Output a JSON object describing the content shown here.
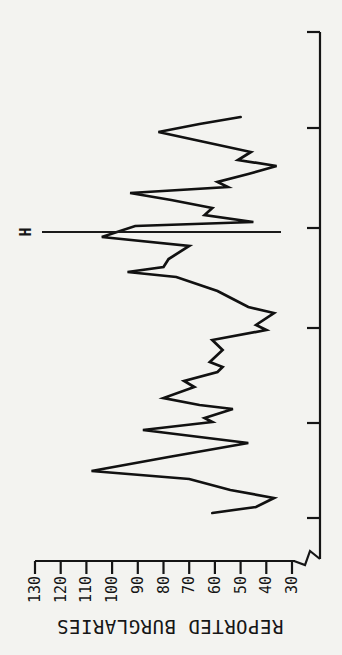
{
  "page": {
    "background": "#f3f3f0",
    "ink": "#151515"
  },
  "chart_data": {
    "type": "line",
    "title": "",
    "xlabel": "",
    "ylabel": "REPORTED BURGLARIES",
    "ylim": [
      30,
      130
    ],
    "yticks": [
      130,
      120,
      110,
      100,
      90,
      80,
      70,
      60,
      50,
      40,
      30
    ],
    "x_axis": {
      "tick_labels": [],
      "tick_positions_px": [
        137,
        232,
        327,
        427,
        527,
        623
      ],
      "axis_start_px": 96,
      "axis_end_px": 623,
      "broken_axis_at_origin": true
    },
    "annotation": {
      "label": "H",
      "x_px": 423,
      "y_top_px": 42,
      "y_bottom_px": 281
    },
    "layout": {
      "rotated_degrees_on_page": -90,
      "grid": false,
      "legend": false,
      "px_at_130": 35,
      "px_at_30": 292
    },
    "series": [
      {
        "points": [
          [
            142,
            61
          ],
          [
            148,
            44
          ],
          [
            157,
            37
          ],
          [
            165,
            54
          ],
          [
            176,
            70
          ],
          [
            184,
            108
          ],
          [
            198,
            78
          ],
          [
            212,
            47
          ],
          [
            225,
            88
          ],
          [
            233,
            61
          ],
          [
            237,
            64
          ],
          [
            246,
            53
          ],
          [
            250,
            66
          ],
          [
            257,
            80
          ],
          [
            268,
            68
          ],
          [
            274,
            72
          ],
          [
            283,
            59
          ],
          [
            288,
            57
          ],
          [
            293,
            62
          ],
          [
            305,
            57
          ],
          [
            315,
            61
          ],
          [
            325,
            40
          ],
          [
            330,
            44
          ],
          [
            342,
            37
          ],
          [
            348,
            47
          ],
          [
            356,
            53
          ],
          [
            364,
            59
          ],
          [
            378,
            75
          ],
          [
            383,
            94
          ],
          [
            388,
            80
          ],
          [
            396,
            78
          ],
          [
            409,
            70
          ],
          [
            418,
            104
          ],
          [
            429,
            91
          ],
          [
            433,
            45
          ],
          [
            440,
            64
          ],
          [
            447,
            61
          ],
          [
            455,
            77
          ],
          [
            462,
            93
          ],
          [
            468,
            55
          ],
          [
            473,
            59
          ],
          [
            481,
            47
          ],
          [
            489,
            36
          ],
          [
            495,
            51
          ],
          [
            503,
            46
          ],
          [
            513,
            64
          ],
          [
            523,
            82
          ],
          [
            531,
            66
          ],
          [
            538,
            50
          ]
        ]
      }
    ]
  }
}
